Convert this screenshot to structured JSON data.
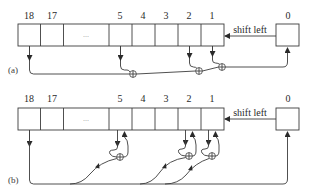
{
  "diagram": {
    "type": "shift-register-feedback",
    "stroke_color": "#3c3c3c",
    "background": "#ffffff",
    "panels": [
      {
        "caption": "(a)",
        "register_cells": [
          "18",
          "17",
          "...",
          "5",
          "4",
          "3",
          "2",
          "1"
        ],
        "input_cell": "0",
        "shift_label": "shift left",
        "taps": [
          "18",
          "5",
          "2",
          "1"
        ],
        "description": "Fibonacci configuration: taps 18, 5, 2, 1 XORed together feed cell 0"
      },
      {
        "caption": "(b)",
        "register_cells": [
          "18",
          "17",
          "...",
          "5",
          "4",
          "3",
          "2",
          "1"
        ],
        "input_cell": "0",
        "shift_label": "shift left",
        "taps": [
          "5",
          "2",
          "1"
        ],
        "description": "Galois configuration: output of cell 18 fed back and XORed into cells 5, 2, 1 and into cell 0"
      }
    ]
  }
}
